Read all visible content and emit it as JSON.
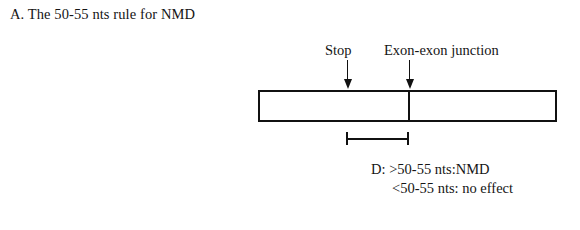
{
  "figure": {
    "panel_title": "A. The 50-55 nts rule for NMD",
    "background_color": "#ffffff",
    "stroke_color": "#111111"
  },
  "diagram": {
    "type": "schematic",
    "transcript": {
      "segments": [
        {
          "name": "upstream-exon",
          "label": ""
        },
        {
          "name": "downstream-exon",
          "label": ""
        }
      ],
      "divider_name": "exon-exon-junction-line"
    },
    "markers": [
      {
        "id": "stop",
        "label": "Stop",
        "arrow": "down-arrow"
      },
      {
        "id": "exon-exon-junction",
        "label": "Exon-exon junction",
        "arrow": "down-arrow"
      }
    ],
    "distance_measure": {
      "name": "stop-to-junction-distance",
      "from": "stop",
      "to": "exon-exon-junction",
      "label": ""
    },
    "rule_note": {
      "line_1": "D: >50-55 nts:NMD",
      "line_2": "<50-55 nts: no effect"
    }
  }
}
